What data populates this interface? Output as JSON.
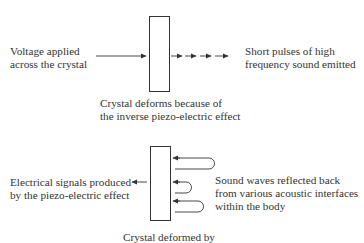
{
  "diagram": {
    "top": {
      "input_label": [
        "Voltage applied",
        "across the crystal"
      ],
      "output_label": [
        "Short pulses of high",
        "frequency sound emitted"
      ],
      "caption": [
        "Crystal deforms because of",
        "the inverse piezo-electric effect"
      ]
    },
    "bottom": {
      "output_label": [
        "Electrical signals produced",
        "by the piezo-electric effect"
      ],
      "input_label": [
        "Sound waves reflected back",
        "from various acoustic interfaces",
        "within the body"
      ],
      "caption": [
        "Crystal deformed by"
      ]
    },
    "colors": {
      "line": "#333333",
      "text": "#333333",
      "background": "#ffffff"
    }
  }
}
